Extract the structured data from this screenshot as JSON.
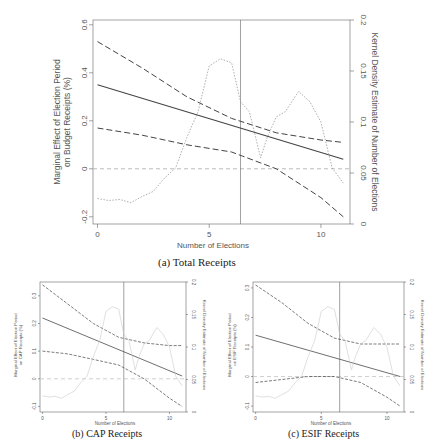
{
  "chart_data": [
    {
      "type": "line",
      "panel": "a",
      "caption": "(a) Total Receipts",
      "xlabel": "Number of Elections",
      "ylabel": "Marginal Effect of Election Period on Budget Receipts (%)",
      "y2label": "Kernel Density Estimate of Number of Elections",
      "xticks": [
        "0",
        "5",
        "10"
      ],
      "yticks": [
        "-0.2",
        "0",
        "0.2",
        "0.4",
        "0.6"
      ],
      "y2ticks": [
        "0",
        "0.05",
        "0.1",
        "0.15",
        "0.2"
      ],
      "xlim": [
        -0.2,
        11.3
      ],
      "ylim": [
        -0.23,
        0.62
      ],
      "y2lim": [
        0,
        0.2
      ],
      "vline_x": 6.4,
      "hline_y": 0,
      "grid": false,
      "series": [
        {
          "name": "marginal effect",
          "style": "solid",
          "x": [
            0,
            11
          ],
          "values": [
            0.35,
            0.04
          ]
        },
        {
          "name": "upper 95% CI",
          "style": "dashed",
          "x": [
            0,
            2,
            4,
            6,
            8,
            10,
            11
          ],
          "values": [
            0.53,
            0.42,
            0.3,
            0.21,
            0.15,
            0.12,
            0.11
          ]
        },
        {
          "name": "lower 95% CI",
          "style": "dashed",
          "x": [
            0,
            2,
            4,
            6,
            8,
            10,
            11
          ],
          "values": [
            0.17,
            0.14,
            0.1,
            0.07,
            0.0,
            -0.12,
            -0.2
          ]
        },
        {
          "name": "kernel density",
          "style": "dotted",
          "axis": "y2",
          "x": [
            0,
            0.5,
            1,
            1.5,
            2,
            2.5,
            3,
            3.5,
            4,
            4.5,
            5,
            5.5,
            6,
            6.4,
            6.8,
            7.3,
            7.6,
            8,
            8.4,
            9,
            9.5,
            10,
            10.5,
            11
          ],
          "values": [
            0.025,
            0.023,
            0.024,
            0.021,
            0.027,
            0.032,
            0.045,
            0.055,
            0.085,
            0.11,
            0.155,
            0.162,
            0.158,
            0.12,
            0.11,
            0.065,
            0.085,
            0.105,
            0.11,
            0.13,
            0.12,
            0.1,
            0.055,
            0.04
          ]
        }
      ]
    },
    {
      "type": "line",
      "panel": "b",
      "caption": "(b) CAP Receipts",
      "xlabel": "Number of Elections",
      "ylabel": "Marginal Effect of Election Period on CAP Receipts (%)",
      "y2label": "Kernel Density Estimate of Number of Elections",
      "xticks": [
        "0",
        "5",
        "10"
      ],
      "yticks": [
        "-0.1",
        "0",
        "0.1",
        "0.2",
        "0.3"
      ],
      "y2ticks": [
        "0",
        "0.05",
        "0.1",
        "0.15",
        "0.2"
      ],
      "xlim": [
        -0.2,
        11.3
      ],
      "ylim": [
        -0.12,
        0.35
      ],
      "y2lim": [
        0,
        0.2
      ],
      "vline_x": 6.4,
      "hline_y": 0,
      "grid": false,
      "series": [
        {
          "name": "marginal effect",
          "style": "solid",
          "x": [
            0,
            11
          ],
          "values": [
            0.22,
            0.01
          ]
        },
        {
          "name": "upper 95% CI",
          "style": "dashed",
          "x": [
            0,
            2,
            4,
            6,
            8,
            10,
            11
          ],
          "values": [
            0.34,
            0.27,
            0.2,
            0.15,
            0.13,
            0.12,
            0.12
          ]
        },
        {
          "name": "lower 95% CI",
          "style": "dashed",
          "x": [
            0,
            2,
            4,
            6,
            8,
            10,
            11
          ],
          "values": [
            0.1,
            0.09,
            0.07,
            0.05,
            0.0,
            -0.07,
            -0.1
          ]
        },
        {
          "name": "kernel density",
          "style": "dotted",
          "axis": "y2",
          "x": [
            0,
            0.5,
            1,
            1.5,
            2,
            2.5,
            3,
            3.5,
            4,
            4.5,
            5,
            5.5,
            6,
            6.4,
            6.8,
            7.3,
            7.6,
            8,
            8.4,
            9,
            9.5,
            10,
            10.5,
            11
          ],
          "values": [
            0.025,
            0.023,
            0.024,
            0.021,
            0.027,
            0.032,
            0.045,
            0.055,
            0.085,
            0.11,
            0.155,
            0.162,
            0.158,
            0.12,
            0.11,
            0.065,
            0.085,
            0.105,
            0.11,
            0.13,
            0.12,
            0.1,
            0.055,
            0.04
          ]
        }
      ]
    },
    {
      "type": "line",
      "panel": "c",
      "caption": "(c) ESIF Receipts",
      "xlabel": "Number of Elections",
      "ylabel": "Marginal Effect of Election Period on ESIF Receipts (%)",
      "y2label": "Kernel Density Estimate of Number of Elections",
      "xticks": [
        "0",
        "5",
        "10"
      ],
      "yticks": [
        "-0.1",
        "0",
        "0.1",
        "0.2",
        "0.3"
      ],
      "y2ticks": [
        "0",
        "0.05",
        "0.1",
        "0.15",
        "0.2"
      ],
      "xlim": [
        -0.2,
        11.3
      ],
      "ylim": [
        -0.12,
        0.32
      ],
      "y2lim": [
        0,
        0.2
      ],
      "vline_x": 6.4,
      "hline_y": 0,
      "grid": false,
      "series": [
        {
          "name": "marginal effect",
          "style": "solid",
          "x": [
            0,
            11
          ],
          "values": [
            0.14,
            0.0
          ]
        },
        {
          "name": "upper 95% CI",
          "style": "dashed",
          "x": [
            0,
            2,
            4,
            6,
            8,
            10,
            11
          ],
          "values": [
            0.31,
            0.25,
            0.18,
            0.13,
            0.11,
            0.11,
            0.11
          ]
        },
        {
          "name": "lower 95% CI",
          "style": "dashed",
          "x": [
            0,
            2,
            4,
            6,
            8,
            10,
            11
          ],
          "values": [
            -0.02,
            -0.01,
            0.0,
            0.0,
            -0.02,
            -0.07,
            -0.1
          ]
        },
        {
          "name": "kernel density",
          "style": "dotted",
          "axis": "y2",
          "x": [
            0,
            0.5,
            1,
            1.5,
            2,
            2.5,
            3,
            3.5,
            4,
            4.5,
            5,
            5.5,
            6,
            6.4,
            6.8,
            7.3,
            7.6,
            8,
            8.4,
            9,
            9.5,
            10,
            10.5,
            11
          ],
          "values": [
            0.025,
            0.023,
            0.024,
            0.021,
            0.027,
            0.032,
            0.045,
            0.055,
            0.085,
            0.11,
            0.155,
            0.162,
            0.158,
            0.12,
            0.11,
            0.065,
            0.085,
            0.105,
            0.11,
            0.13,
            0.12,
            0.1,
            0.055,
            0.04
          ]
        }
      ]
    }
  ],
  "colors": {
    "line": "#444444",
    "ci": "#444444",
    "density": "#999999",
    "zero_line": "#bbbbbb",
    "vline": "#777777",
    "frame": "#666666"
  }
}
